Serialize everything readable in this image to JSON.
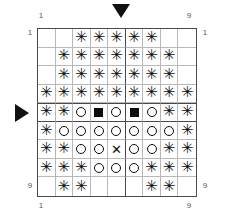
{
  "figure": {
    "type": "grid-pattern",
    "rows": 9,
    "cols": 9,
    "heavy_line_after_col": 5,
    "heavy_line_after_row": 5,
    "heavy_line_before_row": 5
  },
  "axis": {
    "top_left": "1",
    "top_right": "9",
    "left_top": "1",
    "left_bottom": "9",
    "right_top": "1",
    "right_bottom": "9",
    "bottom_left": "1",
    "bottom_right": "9"
  },
  "markers": {
    "top": {
      "icon": "triangle-down-icon",
      "column": 6
    },
    "left": {
      "icon": "triangle-right-icon",
      "row": 5
    }
  },
  "legend": {
    "star": "✳",
    "circle": "○",
    "filled_square": "■",
    "cross": "✕",
    "blank": ""
  },
  "chart_data": {
    "type": "heatmap",
    "title": "",
    "xlabel": "",
    "ylabel": "",
    "categories": [
      "1",
      "2",
      "3",
      "4",
      "5",
      "6",
      "7",
      "8",
      "9"
    ],
    "row_labels": [
      "1",
      "2",
      "3",
      "4",
      "5",
      "6",
      "7",
      "8",
      "9"
    ],
    "symbol_key": {
      "blank": "empty cell",
      "star": "asterisk / star glyph",
      "circle": "open circle",
      "square": "filled square",
      "cross": "x cross"
    },
    "cells": [
      [
        "blank",
        "blank",
        "star",
        "star",
        "star",
        "star",
        "star",
        "blank",
        "blank"
      ],
      [
        "blank",
        "star",
        "star",
        "star",
        "star",
        "star",
        "star",
        "star",
        "blank"
      ],
      [
        "blank",
        "star",
        "star",
        "star",
        "star",
        "star",
        "star",
        "star",
        "blank"
      ],
      [
        "star",
        "star",
        "star",
        "star",
        "star",
        "star",
        "star",
        "star",
        "star"
      ],
      [
        "star",
        "star",
        "circle",
        "square",
        "circle",
        "square",
        "circle",
        "star",
        "star"
      ],
      [
        "star",
        "circle",
        "circle",
        "circle",
        "circle",
        "circle",
        "circle",
        "circle",
        "star"
      ],
      [
        "star",
        "star",
        "circle",
        "circle",
        "cross",
        "circle",
        "circle",
        "star",
        "star"
      ],
      [
        "star",
        "star",
        "star",
        "circle",
        "circle",
        "circle",
        "star",
        "star",
        "star"
      ],
      [
        "blank",
        "star",
        "star",
        "blank",
        "blank",
        "blank",
        "star",
        "star",
        "blank"
      ]
    ]
  }
}
